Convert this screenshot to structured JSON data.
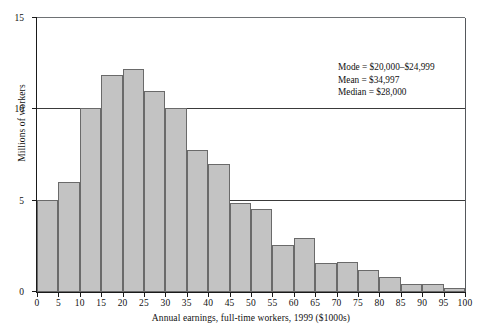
{
  "chart_data": {
    "type": "bar",
    "title": "",
    "subtitle": "",
    "xlabel": "Annual earnings, full-time workers, 1999 ($1000s)",
    "ylabel": "Millions of workers",
    "xlim": [
      0,
      100
    ],
    "ylim": [
      0,
      15
    ],
    "xticks": [
      0,
      5,
      10,
      15,
      20,
      25,
      30,
      35,
      40,
      45,
      50,
      55,
      60,
      65,
      70,
      75,
      80,
      85,
      90,
      95,
      100
    ],
    "yticks": [
      0,
      5,
      10,
      15
    ],
    "grid": "horizontal",
    "legend": "none",
    "bin_width": 5,
    "categories": [
      "0-5",
      "5-10",
      "10-15",
      "15-20",
      "20-25",
      "25-30",
      "30-35",
      "35-40",
      "40-45",
      "45-50",
      "50-55",
      "55-60",
      "60-65",
      "65-70",
      "70-75",
      "75-80",
      "80-85",
      "85-90",
      "90-95",
      "95-100"
    ],
    "bin_starts": [
      0,
      5,
      10,
      15,
      20,
      25,
      30,
      35,
      40,
      45,
      50,
      55,
      60,
      65,
      70,
      75,
      80,
      85,
      90,
      95
    ],
    "values": [
      5.05,
      6.0,
      10.1,
      11.9,
      12.2,
      11.0,
      10.05,
      7.8,
      7.0,
      4.85,
      4.55,
      2.6,
      2.95,
      1.6,
      1.65,
      1.2,
      0.8,
      0.45,
      0.45,
      0.2
    ],
    "bar_fill": "#c3c3c3",
    "bar_stroke": "#6a6a6a",
    "axis_color": "#1a1a1a",
    "annotations": [
      "Mode = $20,000–$24,999",
      "Mean = $34,997",
      "Median = $28,000"
    ]
  },
  "annotation": {
    "mode": "Mode = $20,000–$24,999",
    "mean": "Mean = $34,997",
    "median": "Median = $28,000"
  }
}
